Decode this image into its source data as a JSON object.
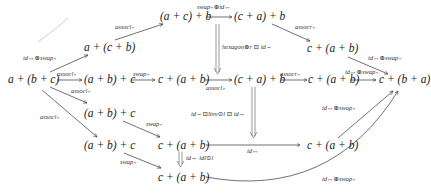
{
  "diagram": {
    "type": "commutative-diagram",
    "nodes": {
      "a_b_c": "a + (b + c)",
      "a_cb": "a + (c + b)",
      "ac_b": "(a + c) + b",
      "ca_b_top": "(c + a) + b",
      "c_ab_topright": "c + (a + b)",
      "ab_c_mid1": "(a + b) + c",
      "c_ab_mid1": "c + (a + b)",
      "ca_b_mid": "(c + a) + b",
      "c_ab_mid2": "c + (a + b)",
      "c_ba": "c + (b + a)",
      "ab_c_low1": "(a + b) + c",
      "ab_c_low2": "(a + b) + c",
      "c_ab_low1": "c + (a + b)",
      "c_ab_right_low": "c + (a + b)",
      "c_ab_bottom": "c + (a + b)"
    },
    "labels": {
      "id_swap_upper_left": "id↔⊕swap₊",
      "assocl_top": "assocl₊",
      "swap_id_top": "swap₊⊕id↔",
      "assocr_top": "assocr₊",
      "id_swap_top_right": "id↔⊕swap₊",
      "hexagon": "hexagon⊕r ⊡ id⇔",
      "assocl_main_above": "assocl₊",
      "assocl_main_below": "assocl₊",
      "swap_main": "swap₊",
      "assocl_under_double": "assocl₊",
      "assocr_mid": "assocr₊",
      "id_swap_mid": "id↔⊕swap₊",
      "assocl_diag_left": "assocl₊",
      "swap_mid_lower": "swap₊",
      "linv": "id⇔⊡linv⊙l ⊡ id⇔",
      "id_under_mid": "id↔",
      "id_right_upper": "id↔⊕swap₊",
      "swap_low": "swap₊",
      "id_idl": "id⇔ idl⊙l",
      "id_swap_bottom": "id↔⊕swap₊"
    }
  }
}
